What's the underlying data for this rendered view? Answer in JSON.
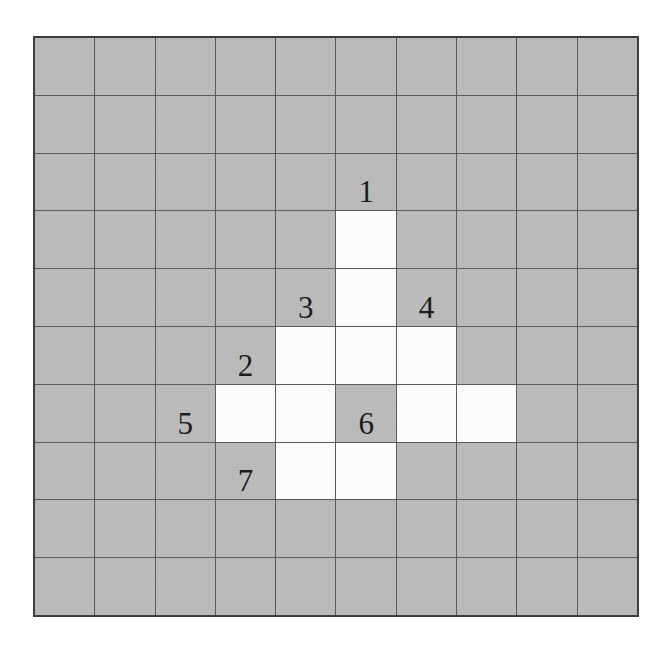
{
  "puzzle": {
    "rows": 10,
    "cols": 10,
    "open_cells": [
      [
        3,
        5
      ],
      [
        4,
        5
      ],
      [
        5,
        4
      ],
      [
        5,
        5
      ],
      [
        5,
        6
      ],
      [
        6,
        3
      ],
      [
        6,
        4
      ],
      [
        6,
        6
      ],
      [
        6,
        7
      ],
      [
        7,
        4
      ],
      [
        7,
        5
      ]
    ],
    "clues": [
      {
        "number": "1",
        "row": 2,
        "col": 5
      },
      {
        "number": "2",
        "row": 5,
        "col": 3
      },
      {
        "number": "3",
        "row": 4,
        "col": 4
      },
      {
        "number": "4",
        "row": 4,
        "col": 6
      },
      {
        "number": "5",
        "row": 6,
        "col": 2
      },
      {
        "number": "6",
        "row": 6,
        "col": 5
      },
      {
        "number": "7",
        "row": 7,
        "col": 3
      }
    ],
    "colors": {
      "shaded_cell": "#bcbcbc",
      "open_cell": "#fcfcfc",
      "grid_line": "#5a5a5a",
      "outer_border": "#3d3d3d",
      "clue_text": "#1b1b1b",
      "page_background": "#ffffff"
    }
  }
}
